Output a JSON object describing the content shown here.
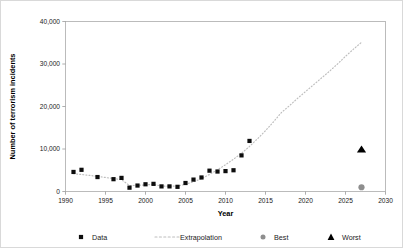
{
  "chart_data": {
    "type": "scatter",
    "title": "",
    "xlabel": "Year",
    "ylabel": "Number of terrorism incidents",
    "xlim": [
      1990,
      2030
    ],
    "ylim": [
      0,
      40000
    ],
    "xticks": [
      1990,
      1995,
      2000,
      2005,
      2010,
      2015,
      2020,
      2025,
      2030
    ],
    "xtick_labels": [
      "1990",
      "1995",
      "2000",
      "2005",
      "2010",
      "2015",
      "2020",
      "2025",
      "2030"
    ],
    "yticks": [
      0,
      10000,
      20000,
      30000,
      40000
    ],
    "ytick_labels": [
      "0",
      "10,000",
      "20,000",
      "30,000",
      "40,000"
    ],
    "grid": false,
    "legend_position": "bottom",
    "series": [
      {
        "name": "Data",
        "type": "scatter",
        "marker": "square",
        "color": "#0d0d0d",
        "x": [
          1991,
          1992,
          1994,
          1996,
          1997,
          1998,
          1999,
          2000,
          2001,
          2002,
          2003,
          2004,
          2005,
          2006,
          2007,
          2008,
          2009,
          2010,
          2011,
          2012,
          2013
        ],
        "y": [
          4600,
          5100,
          3400,
          2900,
          3200,
          900,
          1400,
          1700,
          1800,
          1200,
          1200,
          1100,
          2000,
          2800,
          3300,
          4900,
          4700,
          4800,
          5000,
          8500,
          11900
        ]
      },
      {
        "name": "Extrapolation",
        "type": "line",
        "style": "dotted",
        "color": "#bdbdbd",
        "x": [
          1991,
          1992,
          1993,
          1994,
          1995,
          1996,
          1997,
          1998,
          1999,
          2000,
          2001,
          2002,
          2003,
          2004,
          2005,
          2006,
          2007,
          2008,
          2009,
          2010,
          2011,
          2012,
          2013,
          2014,
          2015,
          2016,
          2017,
          2018,
          2019,
          2020,
          2021,
          2022,
          2023,
          2024,
          2025,
          2026,
          2027
        ],
        "y": [
          4200,
          4000,
          3800,
          3550,
          3300,
          3050,
          2800,
          1400,
          1450,
          1550,
          1700,
          1250,
          1250,
          1300,
          1700,
          2300,
          3000,
          4000,
          5100,
          6300,
          7600,
          9000,
          10600,
          12400,
          14300,
          16400,
          18600,
          20200,
          21900,
          23500,
          25100,
          26700,
          28300,
          30000,
          31800,
          33500,
          35100
        ]
      },
      {
        "name": "Best",
        "type": "scatter",
        "marker": "circle",
        "color": "#8e8e8e",
        "x": [
          2027
        ],
        "y": [
          1000
        ]
      },
      {
        "name": "Worst",
        "type": "scatter",
        "marker": "triangle",
        "color": "#000000",
        "x": [
          2027
        ],
        "y": [
          10000
        ]
      }
    ],
    "legend": [
      {
        "label": "Data",
        "marker": "square",
        "color": "#0d0d0d"
      },
      {
        "label": "Extrapolation",
        "marker": "dotted-line",
        "color": "#bdbdbd"
      },
      {
        "label": "Best",
        "marker": "circle",
        "color": "#8e8e8e"
      },
      {
        "label": "Worst",
        "marker": "triangle",
        "color": "#000000"
      }
    ]
  }
}
